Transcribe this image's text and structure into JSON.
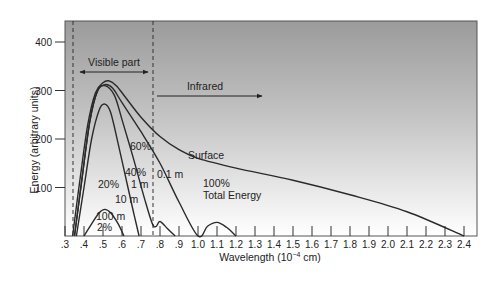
{
  "chart_data": {
    "type": "line",
    "title": "",
    "xlabel": "Wavelength (10⁻⁴ cm)",
    "ylabel": "Energy (arbitrary units)",
    "xlim": [
      0.3,
      2.4
    ],
    "ylim": [
      0,
      440
    ],
    "x_ticks": [
      ".3",
      ".4",
      ".5",
      ".6",
      ".7",
      ".8",
      ".9",
      "1.0",
      "1.1",
      "1.2",
      "1.3",
      "1.4",
      "1.5",
      "1.6",
      "1.7",
      "1.8",
      "1.9",
      "2.0",
      "2.1",
      "2.2",
      "2.3",
      "2.4"
    ],
    "y_ticks": [
      "100",
      "200",
      "300",
      "400"
    ],
    "grid": false,
    "background": "gradient gray (dark top) to white (bottom)",
    "series": [
      {
        "name": "Surface (100% Total Energy)",
        "points": [
          [
            0.34,
            0
          ],
          [
            0.38,
            120
          ],
          [
            0.42,
            230
          ],
          [
            0.46,
            295
          ],
          [
            0.5,
            316
          ],
          [
            0.53,
            320
          ],
          [
            0.57,
            310
          ],
          [
            0.62,
            285
          ],
          [
            0.7,
            245
          ],
          [
            0.8,
            205
          ],
          [
            0.9,
            178
          ],
          [
            1.0,
            160
          ],
          [
            1.2,
            140
          ],
          [
            1.5,
            115
          ],
          [
            1.8,
            85
          ],
          [
            2.1,
            50
          ],
          [
            2.4,
            0
          ]
        ]
      },
      {
        "name": "0.1 m (60%)",
        "points": [
          [
            0.35,
            0
          ],
          [
            0.39,
            120
          ],
          [
            0.43,
            235
          ],
          [
            0.47,
            298
          ],
          [
            0.51,
            312
          ],
          [
            0.55,
            305
          ],
          [
            0.6,
            275
          ],
          [
            0.7,
            215
          ],
          [
            0.8,
            150
          ],
          [
            0.9,
            70
          ],
          [
            1.0,
            0
          ],
          [
            1.05,
            20
          ],
          [
            1.1,
            28
          ],
          [
            1.15,
            18
          ],
          [
            1.2,
            0
          ]
        ]
      },
      {
        "name": "1 m (40%)",
        "points": [
          [
            0.35,
            0
          ],
          [
            0.39,
            120
          ],
          [
            0.43,
            235
          ],
          [
            0.47,
            298
          ],
          [
            0.51,
            310
          ],
          [
            0.56,
            290
          ],
          [
            0.6,
            240
          ],
          [
            0.66,
            160
          ],
          [
            0.72,
            75
          ],
          [
            0.76,
            25
          ],
          [
            0.78,
            20
          ],
          [
            0.8,
            30
          ],
          [
            0.84,
            15
          ],
          [
            0.88,
            0
          ]
        ]
      },
      {
        "name": "10 m (20%)",
        "points": [
          [
            0.36,
            0
          ],
          [
            0.4,
            100
          ],
          [
            0.44,
            200
          ],
          [
            0.48,
            260
          ],
          [
            0.51,
            272
          ],
          [
            0.54,
            255
          ],
          [
            0.58,
            190
          ],
          [
            0.62,
            120
          ],
          [
            0.66,
            50
          ],
          [
            0.69,
            0
          ]
        ]
      },
      {
        "name": "100 m (2%)",
        "points": [
          [
            0.4,
            0
          ],
          [
            0.44,
            25
          ],
          [
            0.48,
            48
          ],
          [
            0.51,
            55
          ],
          [
            0.54,
            48
          ],
          [
            0.58,
            25
          ],
          [
            0.61,
            0
          ]
        ]
      }
    ],
    "annotations": [
      {
        "text": "Visible part",
        "type": "double-arrow",
        "x_range": [
          0.34,
          0.76
        ]
      },
      {
        "text": "Infrared",
        "type": "arrow",
        "from": 0.77,
        "to": 1.32
      },
      {
        "text": "Surface",
        "x": 1.05,
        "y": 165
      },
      {
        "text": "100%",
        "x": 1.05,
        "y": 105
      },
      {
        "text": "Total Energy",
        "x": 1.05,
        "y": 80
      },
      {
        "text": "60%",
        "x": 0.62,
        "y": 185
      },
      {
        "text": "40%",
        "x": 0.65,
        "y": 130
      },
      {
        "text": "1 m",
        "x": 0.68,
        "y": 110
      },
      {
        "text": "0.1 m",
        "x": 0.79,
        "y": 130
      },
      {
        "text": "20%",
        "x": 0.45,
        "y": 110
      },
      {
        "text": "10 m",
        "x": 0.59,
        "y": 80
      },
      {
        "text": "100 m",
        "x": 0.5,
        "y": 35
      },
      {
        "text": "2%",
        "x": 0.51,
        "y": 15
      }
    ],
    "reference_lines": [
      {
        "style": "dashed",
        "x": 0.34,
        "meaning": "visible lower bound"
      },
      {
        "style": "dashed",
        "x": 0.76,
        "meaning": "visible upper bound"
      }
    ]
  },
  "labels": {
    "xlabel": "Wavelength (10",
    "xlabel_exp": "−4",
    "xlabel_unit": " cm)",
    "ylabel": "Energy (arbitrary units)",
    "visible": "Visible part",
    "infrared": "Infrared",
    "surface": "Surface",
    "total_pct": "100%",
    "total": "Total Energy",
    "p60": "60%",
    "p40": "40%",
    "m1": "1 m",
    "m01": "0.1 m",
    "p20": "20%",
    "m10": "10 m",
    "m100": "100 m",
    "p2": "2%"
  }
}
